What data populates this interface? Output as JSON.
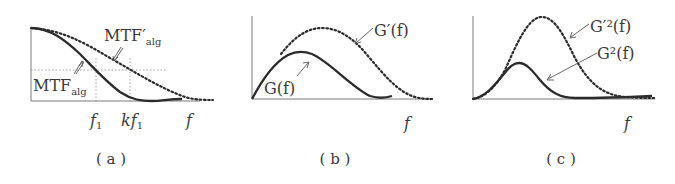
{
  "figure": {
    "panels": [
      {
        "id": "a",
        "caption": "( a )",
        "x_axis_label": "f",
        "tick_labels": [
          {
            "main": "f",
            "sub": "1"
          },
          {
            "main": "kf",
            "sub": "1"
          }
        ],
        "curves": [
          {
            "name": "MTF_alg",
            "label_main": "MTF",
            "label_sub": "alg",
            "style": "solid"
          },
          {
            "name": "MTF'_alg",
            "label_main": "MTF′",
            "label_sub": "alg",
            "style": "dotted"
          }
        ]
      },
      {
        "id": "b",
        "caption": "( b )",
        "x_axis_label": "f",
        "curves": [
          {
            "name": "G(f)",
            "label": "G(f)",
            "style": "solid"
          },
          {
            "name": "G'(f)",
            "label": "G′(f)",
            "style": "dotted"
          }
        ]
      },
      {
        "id": "c",
        "caption": "( c )",
        "x_axis_label": "f",
        "curves": [
          {
            "name": "G^2(f)",
            "label": "G²(f)",
            "style": "solid"
          },
          {
            "name": "G'^2(f)",
            "label": "G′²(f)",
            "style": "dotted"
          }
        ]
      }
    ],
    "colors": {
      "curve": "#2b2b2b",
      "axis": "#7a7a7a",
      "guide": "#8a8a8a",
      "text": "#3a3a3a"
    }
  }
}
